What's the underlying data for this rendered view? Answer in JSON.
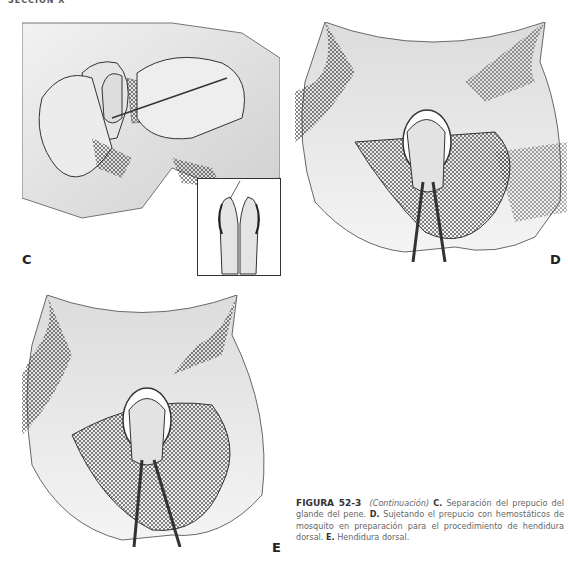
{
  "running_head": "SECCIÓN X",
  "figure": {
    "panels": [
      {
        "id": "C",
        "label": "C",
        "description": "Separación del prepucio del glande del pene con sonda"
      },
      {
        "id": "D",
        "label": "D",
        "description": "Prepucio sujetado con hemostáticos de mosquito"
      },
      {
        "id": "E",
        "label": "E",
        "description": "Hendidura dorsal"
      }
    ],
    "inset_description": "Detalle: separación del prepucio del glande"
  },
  "caption": {
    "figure_number": "FIGURA 52-3",
    "continuation": "(Continuación)",
    "parts": [
      {
        "letter": "C.",
        "text": "Separación del prepucio del glande del pene."
      },
      {
        "letter": "D.",
        "text": "Sujetando el prepucio con hemostáticos de mosquito en preparación para el procedimiento de hendidura dorsal."
      },
      {
        "letter": "E.",
        "text": "Hendidura dorsal."
      }
    ]
  }
}
